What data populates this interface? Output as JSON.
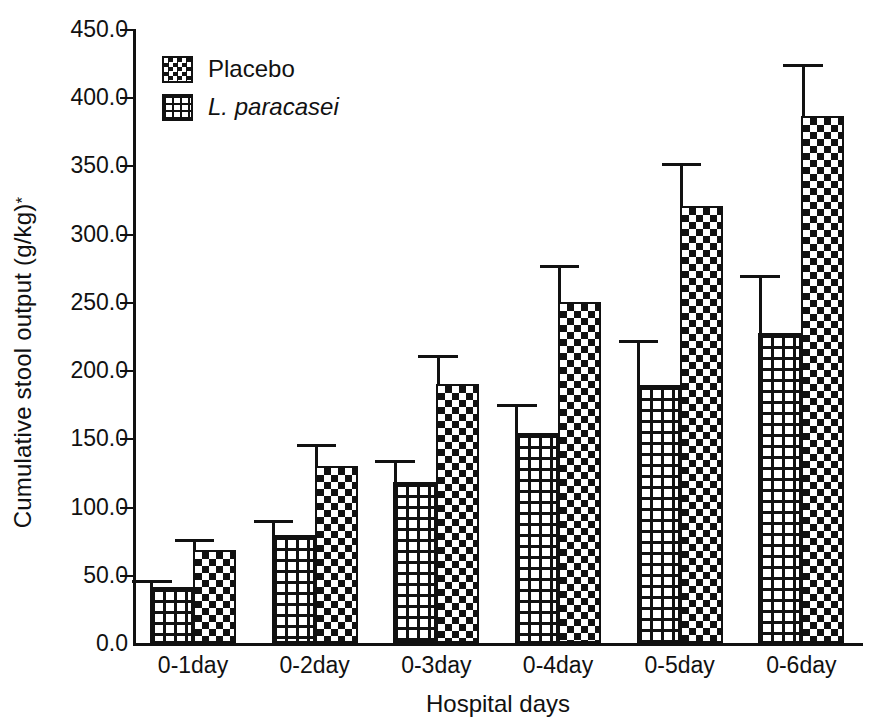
{
  "chart_data": {
    "type": "bar",
    "title": "",
    "xlabel": "Hospital days",
    "ylabel": "Cumulative stool output (g/kg)*",
    "ylabel_base": "Cumulative stool  output (g/kg)",
    "ylabel_superscript": "*",
    "categories": [
      "0-1day",
      "0-2day",
      "0-3day",
      "0-4day",
      "0-5day",
      "0-6day"
    ],
    "ylim": [
      0,
      450
    ],
    "ytick_labels": [
      "0.0",
      "50.0",
      "100.0",
      "150.0",
      "200.0",
      "250.0",
      "300.0",
      "350.0",
      "400.0",
      "450.0"
    ],
    "ytick_values": [
      0,
      50,
      100,
      150,
      200,
      250,
      300,
      350,
      400,
      450
    ],
    "grid": false,
    "legend_position": "top-left",
    "series": [
      {
        "name": "L. paracasei",
        "pattern": "grid",
        "italic": true,
        "values": [
          41,
          79,
          118,
          154,
          189,
          227
        ],
        "errors_upper": [
          46,
          90,
          134,
          175,
          222,
          270
        ]
      },
      {
        "name": "Placebo",
        "pattern": "checker",
        "italic": false,
        "values": [
          68,
          130,
          190,
          250,
          320,
          386
        ],
        "errors_upper": [
          76,
          146,
          211,
          277,
          352,
          424
        ]
      }
    ]
  },
  "legend": {
    "entries": [
      {
        "label": "Placebo",
        "pattern": "checker",
        "italic": false
      },
      {
        "label": "L. paracasei",
        "pattern": "grid",
        "italic": true
      }
    ]
  },
  "colors": {
    "ink": "#111111",
    "background": "#ffffff"
  }
}
